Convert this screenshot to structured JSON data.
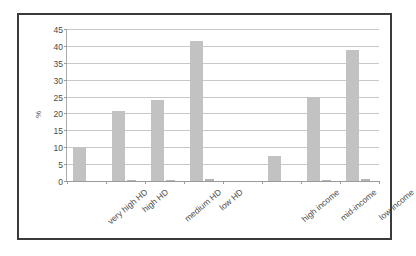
{
  "chart_data": {
    "type": "bar",
    "title": "",
    "subtitle": "",
    "xlabel": "",
    "ylabel": "%",
    "ylim": [
      0,
      45
    ],
    "yticks": [
      0,
      5,
      10,
      15,
      20,
      25,
      30,
      35,
      40,
      45
    ],
    "ytick_labels": [
      "0",
      "5",
      "10",
      "15",
      "20",
      "25",
      "30",
      "35",
      "40",
      "45"
    ],
    "grid": true,
    "legend": false,
    "legend_position": "none",
    "categories": [
      "very high HD",
      "high HD",
      "medium HD",
      "low HD",
      "",
      "high income",
      "mid-income",
      "low income"
    ],
    "series": [
      {
        "name": "main",
        "color": "#c2c2c2",
        "values": [
          10.0,
          20.8,
          24.0,
          41.5,
          0,
          7.5,
          25.0,
          38.7
        ]
      },
      {
        "name": "secondary",
        "color": "#b4b4b4",
        "values": [
          0.0,
          0.3,
          0.4,
          0.6,
          0,
          0.0,
          0.3,
          0.5
        ]
      }
    ],
    "bar_color": "#c2c2c2",
    "gridline_color": "#c8c8c8",
    "axis_color": "#9a9a9a",
    "text_color": "#4a4a4a",
    "frame_color": "#3b3b3b",
    "background": "#ffffff"
  }
}
